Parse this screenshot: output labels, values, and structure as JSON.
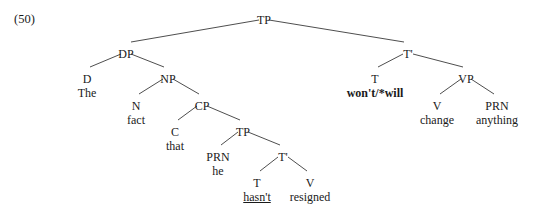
{
  "figure": {
    "example_number": "(50)",
    "sentence": "The fact that he hasn't resigned won't/*will change anything",
    "line_color": "#3a3a3a",
    "text_color": "#1a1a1a",
    "background_color": "#ffffff"
  },
  "chart_data": {
    "type": "tree",
    "title": "(50)",
    "nodes": [
      {
        "id": "TP_root",
        "label": "TP",
        "word": "",
        "x": 264,
        "y": 14,
        "style": "plain"
      },
      {
        "id": "DP",
        "label": "DP",
        "word": "",
        "x": 126,
        "y": 48,
        "style": "plain"
      },
      {
        "id": "D",
        "label": "D",
        "word": "The",
        "x": 87,
        "y": 73,
        "style": "plain"
      },
      {
        "id": "NP",
        "label": "NP",
        "word": "",
        "x": 168,
        "y": 73,
        "style": "plain"
      },
      {
        "id": "N",
        "label": "N",
        "word": "fact",
        "x": 136,
        "y": 100,
        "style": "plain"
      },
      {
        "id": "CP",
        "label": "CP",
        "word": "",
        "x": 202,
        "y": 100,
        "style": "plain"
      },
      {
        "id": "C",
        "label": "C",
        "word": "that",
        "x": 175,
        "y": 126,
        "style": "plain"
      },
      {
        "id": "TP_emb",
        "label": "TP",
        "word": "",
        "x": 243,
        "y": 126,
        "style": "plain"
      },
      {
        "id": "PRN_he",
        "label": "PRN",
        "word": "he",
        "x": 218,
        "y": 151,
        "style": "plain"
      },
      {
        "id": "Tbar_emb",
        "label": "T'",
        "word": "",
        "x": 283,
        "y": 151,
        "style": "plain"
      },
      {
        "id": "T_hasnt",
        "label": "T",
        "word": "hasn't",
        "x": 257,
        "y": 177,
        "style": "underline"
      },
      {
        "id": "V_res",
        "label": "V",
        "word": "resigned",
        "x": 310,
        "y": 177,
        "style": "plain"
      },
      {
        "id": "Tbar_mat",
        "label": "T'",
        "word": "",
        "x": 408,
        "y": 48,
        "style": "plain"
      },
      {
        "id": "T_wont",
        "label": "T",
        "word": "won't/*will",
        "x": 375,
        "y": 73,
        "style": "bold"
      },
      {
        "id": "VP",
        "label": "VP",
        "word": "",
        "x": 466,
        "y": 73,
        "style": "plain"
      },
      {
        "id": "V_change",
        "label": "V",
        "word": "change",
        "x": 437,
        "y": 100,
        "style": "plain"
      },
      {
        "id": "PRN_any",
        "label": "PRN",
        "word": "anything",
        "x": 497,
        "y": 100,
        "style": "plain"
      }
    ],
    "edges": [
      {
        "from": "TP_root",
        "to": "DP",
        "x1": 259,
        "y1": 20,
        "x2": 131,
        "y2": 42
      },
      {
        "from": "TP_root",
        "to": "Tbar_mat",
        "x1": 269,
        "y1": 20,
        "x2": 404,
        "y2": 42
      },
      {
        "from": "DP",
        "to": "D",
        "x1": 121,
        "y1": 54,
        "x2": 90,
        "y2": 67
      },
      {
        "from": "DP",
        "to": "NP",
        "x1": 131,
        "y1": 54,
        "x2": 164,
        "y2": 67
      },
      {
        "from": "NP",
        "to": "N",
        "x1": 163,
        "y1": 79,
        "x2": 139,
        "y2": 94
      },
      {
        "from": "NP",
        "to": "CP",
        "x1": 173,
        "y1": 79,
        "x2": 199,
        "y2": 94
      },
      {
        "from": "CP",
        "to": "C",
        "x1": 197,
        "y1": 106,
        "x2": 178,
        "y2": 120
      },
      {
        "from": "CP",
        "to": "TP_emb",
        "x1": 207,
        "y1": 106,
        "x2": 240,
        "y2": 120
      },
      {
        "from": "TP_emb",
        "to": "PRN_he",
        "x1": 238,
        "y1": 132,
        "x2": 221,
        "y2": 145
      },
      {
        "from": "TP_emb",
        "to": "Tbar_emb",
        "x1": 248,
        "y1": 132,
        "x2": 280,
        "y2": 145
      },
      {
        "from": "Tbar_emb",
        "to": "T_hasnt",
        "x1": 278,
        "y1": 157,
        "x2": 260,
        "y2": 171
      },
      {
        "from": "Tbar_emb",
        "to": "V_res",
        "x1": 288,
        "y1": 157,
        "x2": 307,
        "y2": 171
      },
      {
        "from": "Tbar_mat",
        "to": "T_wont",
        "x1": 403,
        "y1": 54,
        "x2": 378,
        "y2": 67
      },
      {
        "from": "Tbar_mat",
        "to": "VP",
        "x1": 413,
        "y1": 54,
        "x2": 463,
        "y2": 67
      },
      {
        "from": "VP",
        "to": "V_change",
        "x1": 461,
        "y1": 79,
        "x2": 440,
        "y2": 94
      },
      {
        "from": "VP",
        "to": "PRN_any",
        "x1": 471,
        "y1": 79,
        "x2": 494,
        "y2": 94
      }
    ]
  }
}
